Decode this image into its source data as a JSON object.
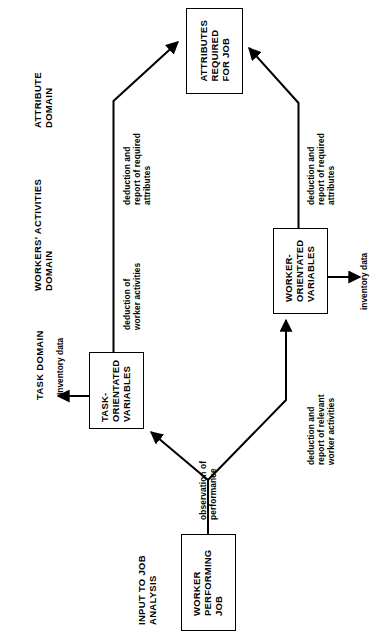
{
  "figure": {
    "orientation": "rotated-90-ccw",
    "type": "flow-diagram",
    "stroke_color": "#000000",
    "background_color": "#ffffff"
  },
  "domains": [
    {
      "id": "attribute",
      "label": "ATTRIBUTE\nDOMAIN"
    },
    {
      "id": "workers-activities",
      "label": "WORKERS' ACTIVITIES\nDOMAIN"
    },
    {
      "id": "task",
      "label": "TASK DOMAIN"
    },
    {
      "id": "input",
      "label": "INPUT TO JOB\nANALYSIS"
    }
  ],
  "domain_labels": {
    "attribute_line1": "ATTRIBUTE",
    "attribute_line2": "DOMAIN",
    "workers_line1": "WORKERS' ACTIVITIES",
    "workers_line2": "DOMAIN",
    "task": "TASK DOMAIN",
    "input_line1": "INPUT TO JOB",
    "input_line2": "ANALYSIS"
  },
  "boxes": {
    "attributes_required": {
      "line1": "ATTRIBUTES",
      "line2": "REQUIRED",
      "line3": "FOR JOB"
    },
    "task_orientated": {
      "line1": "TASK-",
      "line2": "ORIENTATED",
      "line3": "VARIABLES"
    },
    "worker_orientated": {
      "line1": "WORKER-",
      "line2": "ORIENTATED",
      "line3": "VARIABLES"
    },
    "worker_performing": {
      "line1": "WORKER",
      "line2": "PERFORMING",
      "line3": "JOB"
    }
  },
  "edge_labels": {
    "deduction_required_attributes_left": {
      "line1": "deduction and",
      "line2": "report of required",
      "line3": "attributes"
    },
    "deduction_worker_activities": {
      "line1": "deduction of",
      "line2": "worker activities"
    },
    "deduction_required_attributes_right": {
      "line1": "deduction and",
      "line2": "report of required",
      "line3": "attributes"
    },
    "deduction_relevant_worker_activities": {
      "line1": "deduction and",
      "line2": "report of relevant",
      "line3": "worker activities"
    },
    "observation_of_performance": {
      "line1": "observation of",
      "line2": "performance"
    },
    "inventory_data_task": "Inventory data",
    "inventory_data_worker": "inventory data"
  }
}
